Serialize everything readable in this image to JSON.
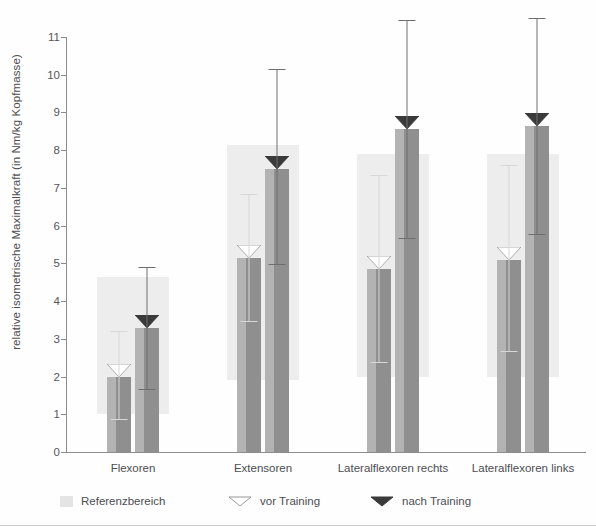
{
  "chart_data": {
    "type": "bar",
    "title": "",
    "xlabel": "",
    "ylabel": "relative isometrische Maximalkraft (in Nm/kg Kopfmasse)",
    "ylim": [
      0,
      11
    ],
    "ytick_labels": [
      "0",
      "1",
      "2",
      "3",
      "4",
      "5",
      "6",
      "7",
      "8",
      "9",
      "10",
      "11"
    ],
    "grid": false,
    "legend_position": "bottom",
    "categories": [
      "Flexoren",
      "Extensoren",
      "Lateralflexoren rechts",
      "Lateralflexoren links"
    ],
    "series": [
      {
        "name": "vor Training",
        "values": [
          2.0,
          5.15,
          4.85,
          5.1
        ],
        "err_low": [
          0.85,
          3.45,
          2.35,
          2.65
        ],
        "err_high": [
          3.2,
          6.85,
          7.35,
          7.6
        ]
      },
      {
        "name": "nach Training",
        "values": [
          3.3,
          7.5,
          8.55,
          8.65
        ],
        "err_low": [
          1.65,
          4.95,
          5.65,
          5.75
        ],
        "err_high": [
          4.9,
          10.15,
          11.45,
          11.5
        ]
      }
    ],
    "reference_bands": [
      {
        "category": "Flexoren",
        "low": 1.0,
        "high": 4.65
      },
      {
        "category": "Extensoren",
        "low": 1.9,
        "high": 8.15
      },
      {
        "category": "Lateralflexoren rechts",
        "low": 2.0,
        "high": 7.9
      },
      {
        "category": "Lateralflexoren links",
        "low": 2.0,
        "high": 7.9
      }
    ],
    "legend": [
      {
        "label": "Referenzbereich",
        "marker": "band-swatch"
      },
      {
        "label": "vor Training",
        "marker": "outline-triangle-down"
      },
      {
        "label": "nach Training",
        "marker": "filled-triangle-down"
      }
    ]
  },
  "colors": {
    "reference_band": "#ededed",
    "bar_face_left": "#b3b3b3",
    "bar_face_right": "#8f8f8f",
    "cap_before_training": "#ffffff",
    "cap_after_training": "#3a3a3a",
    "error_before_training": "#d8d8d8",
    "error_after_training": "#6e6e6e",
    "axis": "#8c8c8c",
    "text": "#4d4d52"
  }
}
